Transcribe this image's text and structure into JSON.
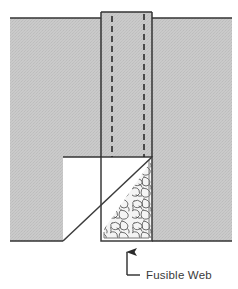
{
  "figure": {
    "background_color": "#ffffff",
    "fabric_fill_color": "#c9c9c9",
    "fabric_texture_color": "#b4b4b4",
    "outline_color": "#333333",
    "dashed_line_color": "#222222",
    "web_fill_color": "#f2f2f2",
    "web_texture_color": "#4a4a4a",
    "label_color": "#3a3a3a"
  },
  "annotation": {
    "label": "Fusible Web",
    "leader_arrow": "up-arrow",
    "leader_style": "elbow-line"
  },
  "parts": {
    "upper_fabric_flap": "upper-fabric-flap",
    "left_fabric_body": "left-fabric-body",
    "right_fabric_body": "right-fabric-body",
    "notch_cutout": "notch-cutout",
    "diagonal_fold_edge": "diagonal-fold-edge",
    "web_column": "fusible-web-column",
    "hidden_edge_left": "hidden-edge-left-dashed",
    "hidden_edge_right": "hidden-edge-right-dashed"
  }
}
